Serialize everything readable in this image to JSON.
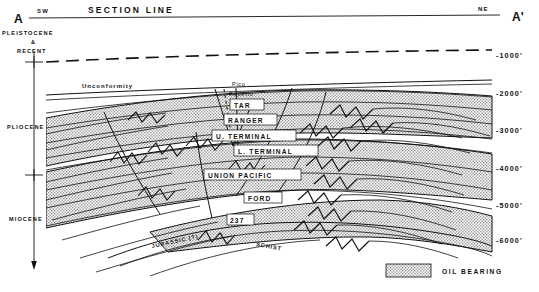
{
  "figure": {
    "header_title": "SECTION   LINE",
    "left_end_label": "A",
    "right_end_label": "A'",
    "left_direction": "SW",
    "right_direction": "NE",
    "unconformity_label": "Unconformity",
    "basement_label_left": "JURASSIC (?)",
    "basement_label_right": "SCHIST"
  },
  "era_axis": {
    "items": [
      {
        "label": "PLEISTOCENE",
        "y": 33
      },
      {
        "label": "&",
        "y": 41
      },
      {
        "label": "RECENT",
        "y": 49
      },
      {
        "label": "PLIOCENE",
        "y": 126
      },
      {
        "label": "MIOCENE",
        "y": 218
      }
    ]
  },
  "depth_axis": {
    "unit": "feet",
    "ticks": [
      {
        "label": "-1000'",
        "value": -1000,
        "y": 55
      },
      {
        "label": "-2000'",
        "value": -2000,
        "y": 93
      },
      {
        "label": "-3000'",
        "value": -3000,
        "y": 130
      },
      {
        "label": "-4000'",
        "value": -4000,
        "y": 168
      },
      {
        "label": "-5000'",
        "value": -5000,
        "y": 205
      },
      {
        "label": "-6000'",
        "value": -6000,
        "y": 240
      }
    ]
  },
  "formations": [
    {
      "name": "Pico",
      "style": "plain",
      "x": 232,
      "y": 84
    },
    {
      "name": "Repetto",
      "style": "plain",
      "x": 232,
      "y": 94
    },
    {
      "name": "TAR",
      "style": "boxed",
      "x": 236,
      "y": 106
    },
    {
      "name": "RANGER",
      "style": "boxed",
      "x": 230,
      "y": 121
    },
    {
      "name": "U. TERMINAL",
      "style": "boxed",
      "x": 219,
      "y": 137
    },
    {
      "name": "L. TERMINAL",
      "style": "boxed",
      "x": 240,
      "y": 152
    },
    {
      "name": "UNION  PACIFIC",
      "style": "boxed",
      "x": 210,
      "y": 176
    },
    {
      "name": "FORD",
      "style": "boxed",
      "x": 249,
      "y": 199
    },
    {
      "name": "237",
      "style": "boxed",
      "x": 232,
      "y": 221
    }
  ],
  "legend": {
    "swatch_label": "OIL BEARING",
    "swatch_fill": "stipple-gray",
    "swatch_color": "#c9c9c9"
  },
  "colors": {
    "ink": "#111111",
    "paper": "#ffffff",
    "oil_bearing_fill": "#c9c9c9"
  }
}
